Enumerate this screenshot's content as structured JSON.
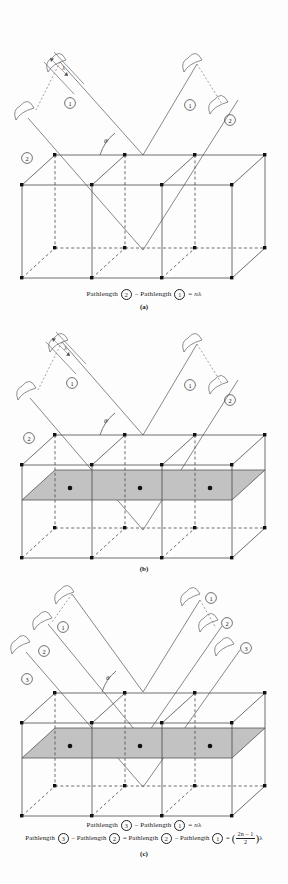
{
  "figure": {
    "background_color": "#fdfdfd",
    "line_color": "#3a3a3a",
    "atom_color": "#111111",
    "shaded_plane_color": "#c2c2c2",
    "beam_color": "#5a5a5a"
  },
  "symbols": {
    "wavelength": "λ",
    "theta": "θ",
    "n": "n",
    "minus": "–",
    "equals": "=",
    "pathlength_word": "Pathlength"
  },
  "panels": [
    {
      "id": "a",
      "letter": "(a)",
      "theta_label": "θ",
      "wavelength_label": "λ",
      "incoming_beams": [
        {
          "label": "1",
          "name": "incident-beam-1"
        },
        {
          "label": "2",
          "name": "incident-beam-2"
        }
      ],
      "outgoing_beams": [
        {
          "label": "1",
          "name": "reflected-beam-1"
        },
        {
          "label": "2",
          "name": "reflected-beam-2"
        }
      ],
      "has_shaded_plane": false,
      "center_atoms": 0,
      "caption_lines": [
        {
          "parts": [
            {
              "type": "text",
              "value": "Pathlength "
            },
            {
              "type": "circled",
              "value": "2"
            },
            {
              "type": "text",
              "value": " – Pathlength "
            },
            {
              "type": "circled",
              "value": "1"
            },
            {
              "type": "text",
              "value": " = "
            },
            {
              "type": "italic",
              "value": "n"
            },
            {
              "type": "text",
              "value": "λ"
            }
          ]
        }
      ]
    },
    {
      "id": "b",
      "letter": "(b)",
      "theta_label": "θ",
      "wavelength_label": "λ",
      "incoming_beams": [
        {
          "label": "1",
          "name": "incident-beam-1"
        },
        {
          "label": "2",
          "name": "incident-beam-2"
        }
      ],
      "outgoing_beams": [
        {
          "label": "1",
          "name": "reflected-beam-1"
        },
        {
          "label": "2",
          "name": "reflected-beam-2"
        }
      ],
      "has_shaded_plane": true,
      "center_atoms": 3,
      "caption_lines": []
    },
    {
      "id": "c",
      "letter": "(c)",
      "theta_label": "θ",
      "wavelength_label": "λ",
      "incoming_beams": [
        {
          "label": "1",
          "name": "incident-beam-1"
        },
        {
          "label": "2",
          "name": "incident-beam-2"
        },
        {
          "label": "3",
          "name": "incident-beam-3"
        }
      ],
      "outgoing_beams": [
        {
          "label": "1",
          "name": "reflected-beam-1"
        },
        {
          "label": "2",
          "name": "reflected-beam-2"
        },
        {
          "label": "3",
          "name": "reflected-beam-3"
        }
      ],
      "has_shaded_plane": true,
      "center_atoms": 3,
      "caption_lines": [
        {
          "parts": [
            {
              "type": "text",
              "value": "Pathlength "
            },
            {
              "type": "circled",
              "value": "3"
            },
            {
              "type": "text",
              "value": " – Pathlength "
            },
            {
              "type": "circled",
              "value": "1"
            },
            {
              "type": "text",
              "value": " = "
            },
            {
              "type": "italic",
              "value": "n"
            },
            {
              "type": "text",
              "value": "λ"
            }
          ]
        },
        {
          "parts": [
            {
              "type": "text",
              "value": "Pathlength "
            },
            {
              "type": "circled",
              "value": "3"
            },
            {
              "type": "text",
              "value": " – Pathlength "
            },
            {
              "type": "circled",
              "value": "2"
            },
            {
              "type": "text",
              "value": " = Pathlength "
            },
            {
              "type": "circled",
              "value": "2"
            },
            {
              "type": "text",
              "value": " – Pathlength "
            },
            {
              "type": "circled",
              "value": "1"
            },
            {
              "type": "text",
              "value": " = "
            },
            {
              "type": "fraction",
              "numerator": "2n – 1",
              "denominator": "2"
            },
            {
              "type": "text",
              "value": "λ"
            }
          ]
        }
      ]
    }
  ]
}
